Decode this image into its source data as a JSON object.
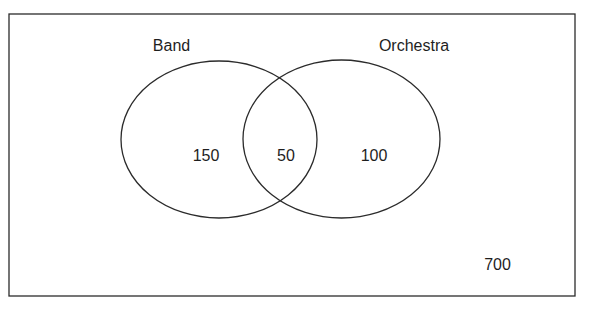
{
  "diagram": {
    "type": "venn",
    "universe": {
      "outside_count": "700"
    },
    "sets": [
      {
        "id": "band",
        "label": "Band",
        "only_count": "150"
      },
      {
        "id": "orchestra",
        "label": "Orchestra",
        "only_count": "100"
      }
    ],
    "intersection": {
      "sets": [
        "Band",
        "Orchestra"
      ],
      "count": "50"
    },
    "colors": {
      "stroke": "#2b2b2b",
      "text": "#1e1e1e",
      "background": "#ffffff"
    }
  }
}
